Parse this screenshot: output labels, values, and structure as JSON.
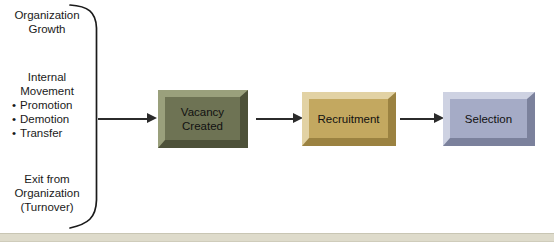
{
  "diagram": {
    "inputs": {
      "group_top": {
        "lines": [
          "Organization",
          "Growth"
        ]
      },
      "group_middle": {
        "lines": [
          "Internal",
          "Movement"
        ],
        "bullets": [
          "Promotion",
          "Demotion",
          "Transfer"
        ]
      },
      "group_bottom": {
        "lines": [
          "Exit from",
          "Organization",
          "(Turnover)"
        ]
      }
    },
    "nodes": [
      {
        "id": "vacancy",
        "label": "Vacancy\nCreated",
        "line1": "Vacancy",
        "line2": "Created",
        "color": "#6e7354"
      },
      {
        "id": "recruitment",
        "label": "Recruitment",
        "line1": "Recruitment",
        "line2": "",
        "color": "#c3a860"
      },
      {
        "id": "selection",
        "label": "Selection",
        "line1": "Selection",
        "line2": "",
        "color": "#a5abc6"
      }
    ],
    "connectors": [
      {
        "id": "brace-to-vacancy",
        "from": "inputs",
        "to": "vacancy"
      },
      {
        "id": "vacancy-to-recruitment",
        "from": "vacancy",
        "to": "recruitment"
      },
      {
        "id": "recruitment-to-selection",
        "from": "recruitment",
        "to": "selection"
      }
    ],
    "colors": {
      "background": "#ffffff",
      "text": "#1a1a1a",
      "arrow": "#2b2b2b",
      "brace": "#1a1a1a",
      "strip": "#dedbcb"
    }
  }
}
